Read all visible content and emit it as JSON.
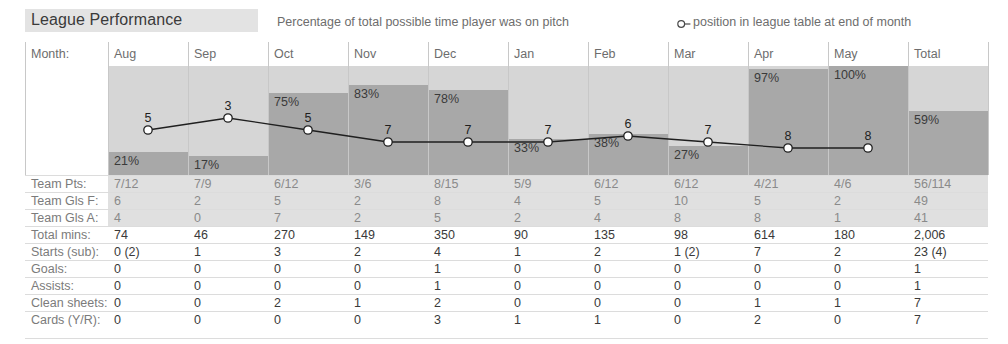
{
  "header": {
    "title": "League Performance",
    "legend_percentage": "Percentage of total possible time player was on pitch",
    "legend_position": "position in league table at end of month",
    "legend_marker_icon": "circle-with-line-icon"
  },
  "table": {
    "month_caption": "Month:",
    "columns": [
      "Aug",
      "Sep",
      "Oct",
      "Nov",
      "Dec",
      "Jan",
      "Feb",
      "Mar",
      "Apr",
      "May",
      "Total"
    ],
    "rows": [
      {
        "label": "Team Pts:",
        "tinted": true,
        "values": [
          "7/12",
          "7/9",
          "6/12",
          "3/6",
          "8/15",
          "5/9",
          "6/12",
          "6/12",
          "4/21",
          "4/6",
          "56/114"
        ]
      },
      {
        "label": "Team Gls F:",
        "tinted": true,
        "values": [
          "6",
          "2",
          "5",
          "2",
          "8",
          "4",
          "5",
          "10",
          "5",
          "2",
          "49"
        ]
      },
      {
        "label": "Team Gls A:",
        "tinted": true,
        "values": [
          "4",
          "0",
          "7",
          "2",
          "5",
          "2",
          "4",
          "8",
          "8",
          "1",
          "41"
        ]
      },
      {
        "label": "Total mins:",
        "tinted": false,
        "values": [
          "74",
          "46",
          "270",
          "149",
          "350",
          "90",
          "135",
          "98",
          "614",
          "180",
          "2,006"
        ]
      },
      {
        "label": "Starts (sub):",
        "tinted": false,
        "values": [
          "0 (2)",
          "1",
          "3",
          "2",
          "4",
          "1",
          "2",
          "1 (2)",
          "7",
          "2",
          "23 (4)"
        ]
      },
      {
        "label": "Goals:",
        "tinted": false,
        "values": [
          "0",
          "0",
          "0",
          "0",
          "1",
          "0",
          "0",
          "0",
          "0",
          "0",
          "1"
        ]
      },
      {
        "label": "Assists:",
        "tinted": false,
        "values": [
          "0",
          "0",
          "0",
          "0",
          "1",
          "0",
          "0",
          "0",
          "0",
          "0",
          "1"
        ]
      },
      {
        "label": "Clean sheets:",
        "tinted": false,
        "values": [
          "0",
          "0",
          "2",
          "1",
          "2",
          "0",
          "0",
          "0",
          "1",
          "1",
          "7"
        ]
      },
      {
        "label": "Cards (Y/R):",
        "tinted": false,
        "values": [
          "0",
          "0",
          "0",
          "0",
          "3",
          "1",
          "1",
          "0",
          "2",
          "0",
          "7"
        ]
      }
    ]
  },
  "colors": {
    "bar_fill": "#a8a8a8",
    "column_background": "#d6d6d6",
    "title_band": "#e3e3e3",
    "row_tint": "#e0e0e0",
    "line": "#1f1f1f",
    "label_text": "#7b7b7b",
    "value_text": "#3a3a3a"
  },
  "chart_data": {
    "type": "bar",
    "title": "League Performance",
    "xlabel": "Month",
    "ylabel": "Percentage of total possible time player was on pitch",
    "ylim": [
      0,
      100
    ],
    "grid": false,
    "legend_position": "top-right",
    "categories": [
      "Aug",
      "Sep",
      "Oct",
      "Nov",
      "Dec",
      "Jan",
      "Feb",
      "Mar",
      "Apr",
      "May",
      "Total"
    ],
    "series": [
      {
        "name": "Percentage of total possible time player was on pitch",
        "type": "bar",
        "values": [
          21,
          17,
          75,
          83,
          78,
          33,
          38,
          27,
          97,
          100,
          59
        ],
        "labels": [
          "21%",
          "17%",
          "75%",
          "83%",
          "78%",
          "33%",
          "38%",
          "27%",
          "97%",
          "100%",
          "59%"
        ]
      },
      {
        "name": "position in league table at end of month",
        "type": "line",
        "axis": "position",
        "values": [
          5,
          3,
          5,
          7,
          7,
          7,
          6,
          7,
          8,
          8,
          null
        ],
        "labels": [
          "5",
          "3",
          "5",
          "7",
          "7",
          "7",
          "6",
          "7",
          "8",
          "8",
          ""
        ]
      }
    ]
  }
}
